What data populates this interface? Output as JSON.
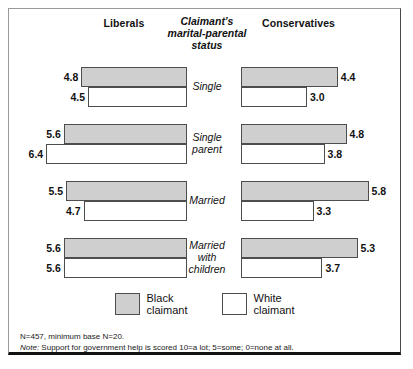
{
  "header": {
    "left_label": "Liberals",
    "right_label": "Conservatives",
    "center_label": "Claimant's marital-parental status"
  },
  "legend": {
    "black": {
      "line1": "Black",
      "line2": "claimant",
      "color": "#cfcfcf"
    },
    "white": {
      "line1": "White",
      "line2": "claimant",
      "color": "#ffffff"
    }
  },
  "notes": {
    "base": "N=457, minimum base N=20.",
    "note_prefix": "Note:",
    "note_text": " Support for government help is scored 10=a lot; 5=some; 0=none at all."
  },
  "chart_data": {
    "type": "bar",
    "title": "",
    "orientation": "horizontal-diverging",
    "xlabel": "",
    "ylabel": "",
    "scale_max": 10,
    "px_per_unit": 22,
    "categories": [
      "Single",
      "Single parent",
      "Married",
      "Married with children"
    ],
    "groups": [
      "Liberals",
      "Conservatives"
    ],
    "series": [
      {
        "name": "Black claimant",
        "color": "#cfcfcf",
        "Liberals": [
          4.8,
          5.6,
          5.5,
          5.6
        ],
        "Conservatives": [
          4.4,
          4.8,
          5.8,
          5.3
        ]
      },
      {
        "name": "White claimant",
        "color": "#ffffff",
        "Liberals": [
          4.5,
          6.4,
          4.7,
          5.6
        ],
        "Conservatives": [
          3.0,
          3.8,
          3.3,
          3.7
        ]
      }
    ],
    "rows": [
      {
        "category": "Single",
        "category_lines": [
          "Single"
        ],
        "left": {
          "black": "4.8",
          "white": "4.5"
        },
        "right": {
          "black": "4.4",
          "white": "3.0"
        }
      },
      {
        "category": "Single parent",
        "category_lines": [
          "Single",
          "parent"
        ],
        "left": {
          "black": "5.6",
          "white": "6.4"
        },
        "right": {
          "black": "4.8",
          "white": "3.8"
        }
      },
      {
        "category": "Married",
        "category_lines": [
          "Married"
        ],
        "left": {
          "black": "5.5",
          "white": "4.7"
        },
        "right": {
          "black": "5.8",
          "white": "3.3"
        }
      },
      {
        "category": "Married with children",
        "category_lines": [
          "Married",
          "with",
          "children"
        ],
        "left": {
          "black": "5.6",
          "white": "5.6"
        },
        "right": {
          "black": "5.3",
          "white": "3.7"
        }
      }
    ]
  }
}
